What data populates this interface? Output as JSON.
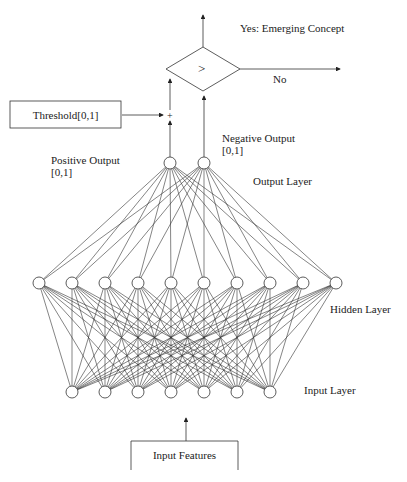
{
  "labels": {
    "yes": "Yes: Emerging Concept",
    "no": "No",
    "comparator": ">",
    "plus": "+",
    "threshold_box": "Threshold[0,1]",
    "positive_output": "Positive Output",
    "positive_range": "[0,1]",
    "negative_output": "Negative Output",
    "negative_range": "[0,1]",
    "output_layer": "Output Layer",
    "hidden_layer": "Hidden Layer",
    "input_layer": "Input Layer",
    "input_features": "Input Features"
  },
  "network": {
    "node_radius": 6,
    "output_layer": {
      "y": 163,
      "x": [
        170,
        204
      ]
    },
    "hidden_layer": {
      "y": 283,
      "x": [
        39,
        72,
        105,
        138,
        171,
        204,
        237,
        270,
        303,
        336
      ]
    },
    "input_layer": {
      "y": 392,
      "x": [
        72,
        105,
        138,
        171,
        204,
        237,
        270
      ]
    }
  },
  "colors": {
    "stroke": "#333333",
    "text": "#222222",
    "background": "#ffffff"
  }
}
